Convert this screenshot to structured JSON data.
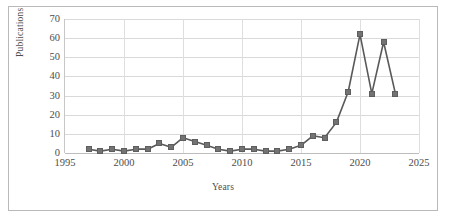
{
  "chart_data": {
    "type": "line",
    "title": "",
    "xlabel": "Years",
    "ylabel": "Publications",
    "xlim": [
      1995,
      2025
    ],
    "ylim": [
      0,
      70
    ],
    "xticks": [
      1995,
      2000,
      2005,
      2010,
      2015,
      2020,
      2025
    ],
    "yticks": [
      0,
      10,
      20,
      30,
      40,
      50,
      60,
      70
    ],
    "grid": "horizontal-and-vertical",
    "legend": "none",
    "marker": "square",
    "series_color": "#737373",
    "line_color": "#595959",
    "x": [
      1997,
      1998,
      1999,
      2000,
      2001,
      2002,
      2003,
      2004,
      2005,
      2006,
      2007,
      2008,
      2009,
      2010,
      2011,
      2012,
      2013,
      2014,
      2015,
      2016,
      2017,
      2018,
      2019,
      2020,
      2021,
      2022,
      2023
    ],
    "values": [
      2,
      1,
      2,
      1,
      2,
      2,
      5,
      3,
      8,
      6,
      4,
      2,
      1,
      2,
      2,
      1,
      1,
      2,
      4,
      9,
      8,
      16,
      32,
      62,
      31,
      58,
      31
    ],
    "series": [
      {
        "name": "Publications",
        "values": [
          2,
          1,
          2,
          1,
          2,
          2,
          5,
          3,
          8,
          6,
          4,
          2,
          1,
          2,
          2,
          1,
          1,
          2,
          4,
          9,
          8,
          16,
          32,
          62,
          31,
          58,
          31
        ]
      }
    ]
  },
  "axes": {
    "y_tick_labels": [
      "70",
      "60",
      "50",
      "40",
      "30",
      "20",
      "10",
      "0"
    ],
    "x_tick_labels": [
      "1995",
      "2000",
      "2005",
      "2010",
      "2015",
      "2020",
      "2025"
    ],
    "y_axis_title": "Publications",
    "x_axis_title": "Years"
  },
  "colors": {
    "marker_fill": "#737373",
    "marker_stroke": "#5e5e5e",
    "line": "#595959",
    "gridline": "#d9d9d9",
    "axis": "#bdbdbd",
    "border": "#b9b9b9",
    "text": "#4d4d4d",
    "background": "#ffffff"
  }
}
